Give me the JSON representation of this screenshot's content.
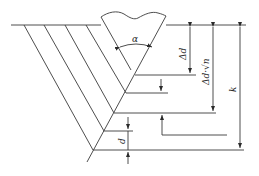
{
  "diagram": {
    "type": "weld-groove-layer-diagram",
    "labels": {
      "angle": "α",
      "layer_step": "Δd",
      "step_sqrt_n": "Δd·√n",
      "total_depth": "k",
      "layer_thickness": "d"
    },
    "colors": {
      "line": "#3a3a3a",
      "background": "#ffffff"
    },
    "hatch_line_count": 4
  }
}
